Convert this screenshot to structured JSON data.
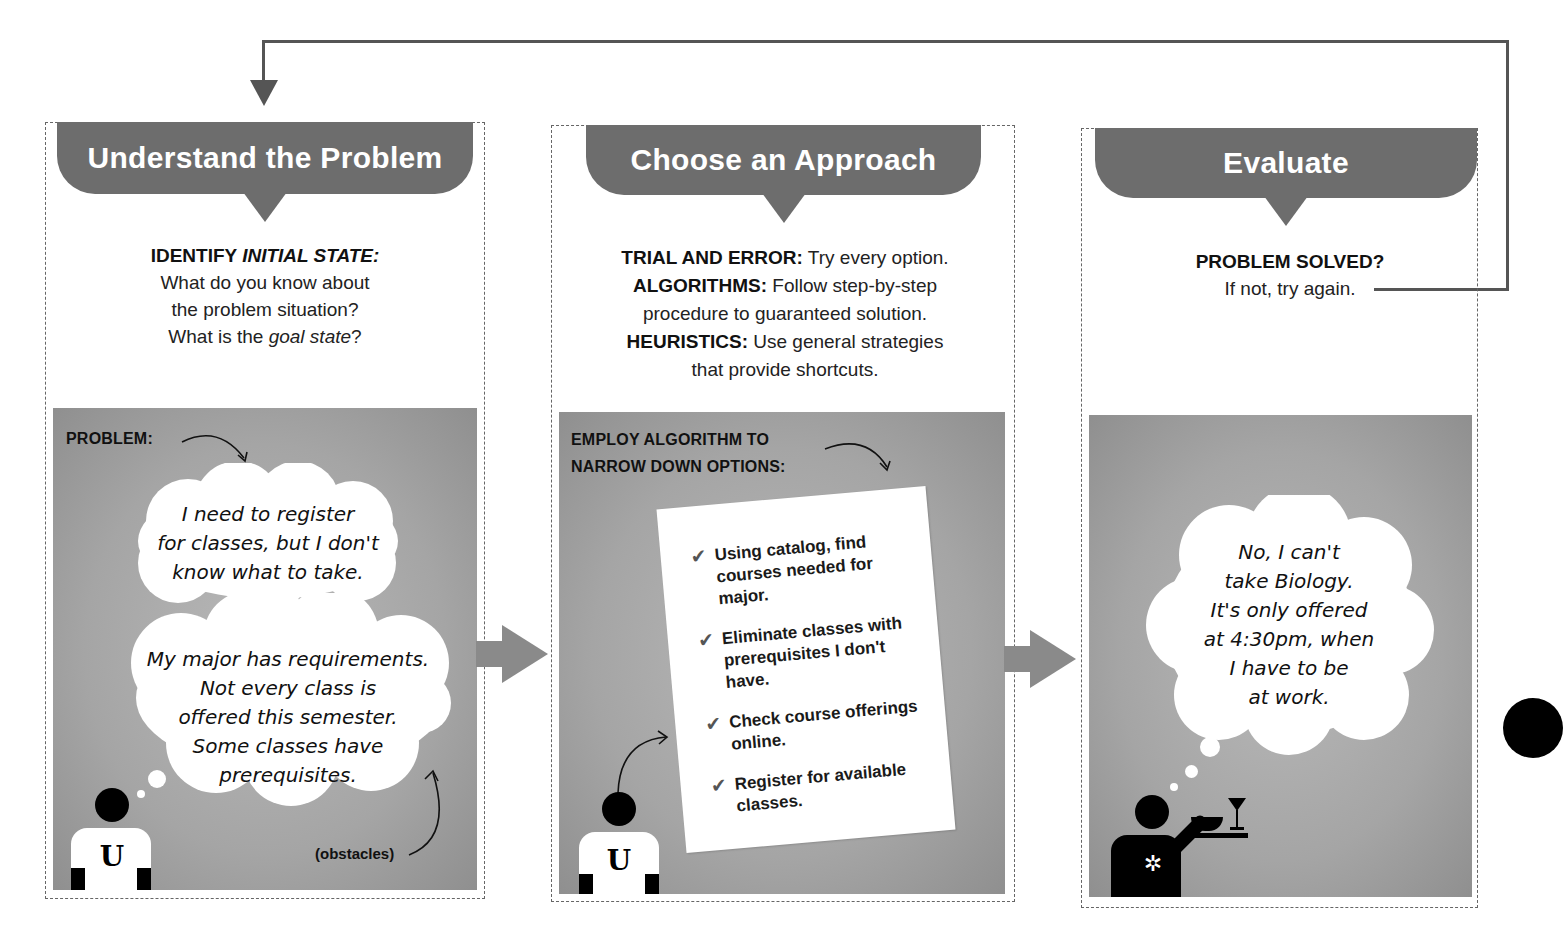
{
  "diagram": {
    "loop_arrow": {
      "color": "#555555",
      "direction": "from Evaluate back to Understand the Problem"
    },
    "connector_color": "#8a8a8a",
    "banner_color": "#6d6d6d",
    "steps": [
      {
        "title": "Understand the Problem",
        "desc": {
          "bold": "IDENTIFY ",
          "bold_italic": "INITIAL STATE:",
          "line1": "What do you know about",
          "line2": "the problem situation?",
          "line3_pre": "What is the ",
          "line3_italic": "goal state",
          "line3_post": "?"
        },
        "scene": {
          "caption": "PROBLEM:",
          "thought1": [
            "I need to register",
            "for classes, but I don't",
            "know what to take."
          ],
          "thought2": [
            "My major has requirements.",
            "Not every class is",
            "offered this semester.",
            "Some classes have",
            "prerequisites."
          ],
          "annotation": "(obstacles)",
          "figure": {
            "shirt_letter": "U",
            "icon": "student-figure"
          }
        }
      },
      {
        "title": "Choose an Approach",
        "desc": {
          "items": [
            {
              "bold": "TRIAL AND ERROR:",
              "text": " Try every option."
            },
            {
              "bold": "ALGORITHMS:",
              "text": " Follow step-by-step"
            },
            {
              "bold": "",
              "text": "procedure to guaranteed solution."
            },
            {
              "bold": "HEURISTICS:",
              "text": " Use general strategies"
            },
            {
              "bold": "",
              "text": "that provide shortcuts."
            }
          ]
        },
        "scene": {
          "caption_line1": "EMPLOY ALGORITHM TO",
          "caption_line2": "NARROW DOWN OPTIONS:",
          "checklist": [
            {
              "check": "✔",
              "text": "Using catalog, find courses needed for major."
            },
            {
              "check": "✔",
              "text": "Eliminate classes with prerequisites I don't have."
            },
            {
              "check": "✔",
              "text": "Check course offerings online."
            },
            {
              "check": "✔",
              "text": "Register for available classes."
            }
          ],
          "figure": {
            "shirt_letter": "U",
            "icon": "student-figure"
          }
        }
      },
      {
        "title": "Evaluate",
        "desc": {
          "bold": "PROBLEM SOLVED?",
          "text": "If not, try again."
        },
        "scene": {
          "thought": [
            "No, I can't",
            "take Biology.",
            "It's only offered",
            "at 4:30pm, when",
            "I have to be",
            "at work."
          ],
          "figure": {
            "icon": "waiter-figure",
            "shirt_symbol": "✲"
          }
        }
      }
    ]
  }
}
